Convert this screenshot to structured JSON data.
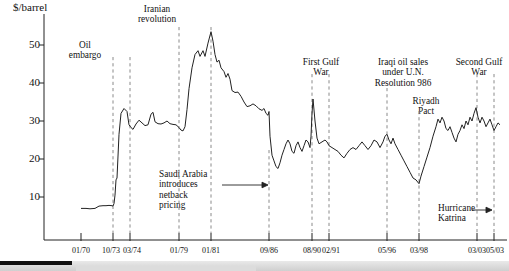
{
  "chart_data": {
    "type": "line",
    "title": "",
    "xlabel": "",
    "ylabel": "$/barrel",
    "ylim": [
      0,
      56
    ],
    "yticks": [
      10,
      20,
      30,
      40,
      50
    ],
    "grid": false,
    "legend": "none",
    "xtick_labels": [
      "01/70",
      "10/73",
      "03/74",
      "01/79",
      "01/81",
      "09/86",
      "08/90",
      "02/91",
      "05/96",
      "03/98",
      "03/03",
      "05/03"
    ],
    "xtick_positions_px": [
      81,
      113,
      130,
      179,
      211,
      269,
      312,
      329,
      387,
      419,
      477,
      494
    ],
    "series": [
      {
        "name": "Crude oil price",
        "units": "$/barrel",
        "x_start": "01/70",
        "x_end": "after 05/03",
        "points": [
          [
            81,
            7.0
          ],
          [
            86,
            7.0
          ],
          [
            90,
            6.9
          ],
          [
            95,
            7.0
          ],
          [
            99,
            7.6
          ],
          [
            103,
            7.7
          ],
          [
            106,
            7.7
          ],
          [
            109,
            7.8
          ],
          [
            112,
            7.7
          ],
          [
            113,
            7.6
          ],
          [
            114,
            8.3
          ],
          [
            115,
            10.5
          ],
          [
            116,
            14.5
          ],
          [
            117,
            15.0
          ],
          [
            119,
            26.5
          ],
          [
            121,
            32.0
          ],
          [
            124,
            33.3
          ],
          [
            127,
            32.5
          ],
          [
            129,
            29.0
          ],
          [
            131,
            28.3
          ],
          [
            133,
            27.8
          ],
          [
            136,
            29.2
          ],
          [
            139,
            30.2
          ],
          [
            142,
            29.5
          ],
          [
            145,
            28.8
          ],
          [
            148,
            29.0
          ],
          [
            151,
            31.8
          ],
          [
            153,
            32.3
          ],
          [
            155,
            29.8
          ],
          [
            158,
            29.3
          ],
          [
            161,
            29.2
          ],
          [
            164,
            29.5
          ],
          [
            167,
            30.0
          ],
          [
            170,
            29.3
          ],
          [
            173,
            29.1
          ],
          [
            176,
            29.0
          ],
          [
            179,
            28.3
          ],
          [
            181,
            27.6
          ],
          [
            183,
            27.4
          ],
          [
            185,
            28.5
          ],
          [
            187,
            33.0
          ],
          [
            189,
            38.5
          ],
          [
            192,
            44.0
          ],
          [
            195,
            47.5
          ],
          [
            198,
            48.5
          ],
          [
            200,
            47.0
          ],
          [
            203,
            48.5
          ],
          [
            205,
            47.0
          ],
          [
            208,
            50.5
          ],
          [
            211,
            53.5
          ],
          [
            213,
            51.0
          ],
          [
            215,
            47.5
          ],
          [
            217,
            45.5
          ],
          [
            219,
            46.0
          ],
          [
            221,
            44.0
          ],
          [
            224,
            43.0
          ],
          [
            226,
            41.5
          ],
          [
            228,
            42.5
          ],
          [
            230,
            41.0
          ],
          [
            232,
            38.0
          ],
          [
            235,
            37.5
          ],
          [
            238,
            37.6
          ],
          [
            241,
            36.5
          ],
          [
            244,
            35.0
          ],
          [
            247,
            33.8
          ],
          [
            250,
            34.0
          ],
          [
            253,
            34.5
          ],
          [
            256,
            34.0
          ],
          [
            259,
            33.2
          ],
          [
            262,
            32.8
          ],
          [
            264,
            33.3
          ],
          [
            266,
            32.0
          ],
          [
            268,
            31.5
          ],
          [
            269,
            32.5
          ],
          [
            270,
            26.0
          ],
          [
            272,
            21.0
          ],
          [
            274,
            19.5
          ],
          [
            276,
            18.0
          ],
          [
            278,
            17.5
          ],
          [
            280,
            19.0
          ],
          [
            282,
            21.0
          ],
          [
            284,
            22.5
          ],
          [
            286,
            24.0
          ],
          [
            288,
            25.0
          ],
          [
            290,
            24.0
          ],
          [
            292,
            22.0
          ],
          [
            294,
            21.5
          ],
          [
            296,
            23.5
          ],
          [
            298,
            24.5
          ],
          [
            300,
            23.0
          ],
          [
            302,
            22.0
          ],
          [
            304,
            23.5
          ],
          [
            306,
            25.0
          ],
          [
            308,
            24.5
          ],
          [
            310,
            23.0
          ],
          [
            311,
            26.0
          ],
          [
            312,
            32.0
          ],
          [
            313,
            35.8
          ],
          [
            315,
            30.0
          ],
          [
            317,
            25.5
          ],
          [
            319,
            24.0
          ],
          [
            322,
            24.5
          ],
          [
            325,
            25.0
          ],
          [
            327,
            24.5
          ],
          [
            329,
            23.5
          ],
          [
            332,
            23.0
          ],
          [
            335,
            22.5
          ],
          [
            338,
            22.0
          ],
          [
            341,
            21.0
          ],
          [
            344,
            20.3
          ],
          [
            347,
            21.5
          ],
          [
            350,
            22.5
          ],
          [
            353,
            23.0
          ],
          [
            356,
            22.5
          ],
          [
            359,
            23.5
          ],
          [
            362,
            24.5
          ],
          [
            365,
            23.5
          ],
          [
            368,
            22.5
          ],
          [
            371,
            23.5
          ],
          [
            374,
            25.0
          ],
          [
            377,
            24.5
          ],
          [
            380,
            23.0
          ],
          [
            383,
            24.5
          ],
          [
            385,
            26.0
          ],
          [
            387,
            26.5
          ],
          [
            389,
            25.0
          ],
          [
            391,
            24.0
          ],
          [
            393,
            25.5
          ],
          [
            395,
            24.0
          ],
          [
            398,
            22.5
          ],
          [
            401,
            21.0
          ],
          [
            404,
            19.5
          ],
          [
            407,
            18.0
          ],
          [
            410,
            16.5
          ],
          [
            413,
            15.0
          ],
          [
            416,
            14.5
          ],
          [
            419,
            13.5
          ],
          [
            421,
            15.5
          ],
          [
            424,
            18.0
          ],
          [
            427,
            20.5
          ],
          [
            430,
            23.0
          ],
          [
            433,
            26.0
          ],
          [
            436,
            28.5
          ],
          [
            438,
            30.5
          ],
          [
            440,
            29.5
          ],
          [
            442,
            31.0
          ],
          [
            444,
            30.0
          ],
          [
            446,
            28.0
          ],
          [
            448,
            27.5
          ],
          [
            450,
            28.5
          ],
          [
            452,
            27.0
          ],
          [
            454,
            25.5
          ],
          [
            456,
            24.5
          ],
          [
            458,
            26.5
          ],
          [
            460,
            27.5
          ],
          [
            462,
            29.0
          ],
          [
            464,
            28.0
          ],
          [
            466,
            30.0
          ],
          [
            468,
            29.0
          ],
          [
            470,
            31.0
          ],
          [
            472,
            30.0
          ],
          [
            474,
            32.0
          ],
          [
            476,
            33.5
          ],
          [
            478,
            31.0
          ],
          [
            480,
            29.5
          ],
          [
            482,
            31.0
          ],
          [
            484,
            30.0
          ],
          [
            486,
            28.5
          ],
          [
            488,
            29.5
          ],
          [
            490,
            30.5
          ],
          [
            492,
            29.0
          ],
          [
            494,
            27.5
          ],
          [
            496,
            28.5
          ],
          [
            498,
            29.5
          ],
          [
            500,
            29.0
          ]
        ]
      }
    ],
    "event_lines": [
      {
        "label": "10/73",
        "x_px": 113
      },
      {
        "label": "03/74",
        "x_px": 130
      },
      {
        "label": "01/79",
        "x_px": 179
      },
      {
        "label": "01/81",
        "x_px": 211
      },
      {
        "label": "09/86",
        "x_px": 269
      },
      {
        "label": "08/90",
        "x_px": 312
      },
      {
        "label": "02/91",
        "x_px": 329
      },
      {
        "label": "05/96",
        "x_px": 387
      },
      {
        "label": "03/98",
        "x_px": 419
      },
      {
        "label": "03/03",
        "x_px": 477
      },
      {
        "label": "05/03",
        "x_px": 494
      }
    ],
    "annotations": [
      {
        "id": "oil-embargo",
        "text": "Oil\nembargo",
        "line1": "Oil",
        "line2": "embargo"
      },
      {
        "id": "iranian-revolution",
        "text": "Iranian\nrevolution",
        "line1": "Iranian",
        "line2": "revolution"
      },
      {
        "id": "saudi-netback",
        "line1": "Saudi Arabia",
        "line2": "introduces",
        "line3": "netback",
        "line4": "pricing",
        "has_arrow": true
      },
      {
        "id": "first-gulf-war",
        "line1": "First Gulf",
        "line2": "War"
      },
      {
        "id": "iraqi-oil-sales",
        "line1": "Iraqi oil sales",
        "line2": "under U.N.",
        "line3": "Resolution 986"
      },
      {
        "id": "riyadh-pact",
        "line1": "Riyadh",
        "line2": "Pact"
      },
      {
        "id": "second-gulf-war",
        "line1": "Second Gulf",
        "line2": "War"
      },
      {
        "id": "hurricane-katrina",
        "line1": "Hurricane",
        "line2": "Katrina",
        "has_arrow": true
      }
    ]
  },
  "axis": {
    "unit_label": "$/barrel",
    "y_labels": [
      "50",
      "40",
      "30",
      "20",
      "10"
    ],
    "x_labels": [
      "01/70",
      "10/73",
      "03/74",
      "01/79",
      "01/81",
      "09/86",
      "08/90",
      "02/91",
      "05/96",
      "03/98",
      "03/03",
      "05/03"
    ]
  },
  "annotations_text": {
    "oil_embargo_l1": "Oil",
    "oil_embargo_l2": "embargo",
    "iranian_rev_l1": "Iranian",
    "iranian_rev_l2": "revolution",
    "saudi_l1": "Saudi Arabia",
    "saudi_l2": "introduces",
    "saudi_l3": "netback",
    "saudi_l4": "pricing",
    "first_gulf_l1": "First Gulf",
    "first_gulf_l2": "War",
    "iraqi_l1": "Iraqi oil sales",
    "iraqi_l2": "under U.N.",
    "iraqi_l3": "Resolution 986",
    "riyadh_l1": "Riyadh",
    "riyadh_l2": "Pact",
    "second_gulf_l1": "Second Gulf",
    "second_gulf_l2": "War",
    "katrina_l1": "Hurricane",
    "katrina_l2": "Katrina"
  },
  "colors": {
    "line": "#222222",
    "axis": "#222222",
    "event_line": "#888888",
    "text": "#111111",
    "scrollbar_track": "#d8d8d8",
    "scrollbar_thumb": "#111111"
  }
}
